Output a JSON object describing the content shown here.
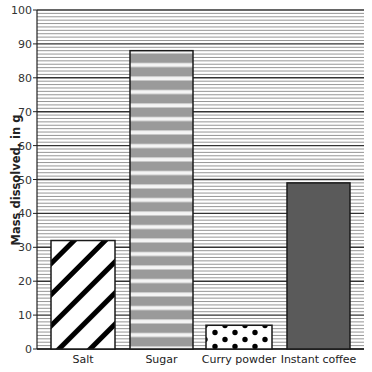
{
  "chart_data": {
    "type": "bar",
    "title": "",
    "xlabel": "",
    "ylabel": "Mass dissolved, in g",
    "categories": [
      "Salt",
      "Sugar",
      "Curry powder",
      "Instant coffee"
    ],
    "values": [
      32,
      88,
      7,
      49
    ],
    "ylim": [
      0,
      100
    ],
    "yticks": [
      0,
      10,
      20,
      30,
      40,
      50,
      60,
      70,
      80,
      90,
      100
    ],
    "grid": true,
    "minor_grid_step": 2,
    "legend": null,
    "bar_patterns": [
      "diagonal-hatch",
      "horizontal-stripes-gray",
      "polka-dots",
      "solid-dark-gray"
    ]
  },
  "colors": {
    "grid_major": "#333333",
    "grid_minor": "#8a8a8a",
    "sugar_fill": "#9a9a9a",
    "coffee_fill": "#5a5a5a",
    "bar_outline": "#1a1a1a"
  }
}
